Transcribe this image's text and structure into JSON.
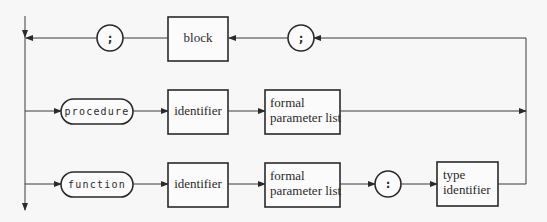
{
  "diagram": {
    "type": "syntax-diagram",
    "top_row": {
      "left_separator": ";",
      "block": "block",
      "right_separator": ";"
    },
    "procedure_row": {
      "keyword": "procedure",
      "identifier": "identifier",
      "params_line1": "formal",
      "params_line2": "parameter list"
    },
    "function_row": {
      "keyword": "function",
      "identifier": "identifier",
      "params_line1": "formal",
      "params_line2": "parameter list",
      "colon": ":",
      "type_line1": "type",
      "type_line2": "identifier"
    }
  }
}
